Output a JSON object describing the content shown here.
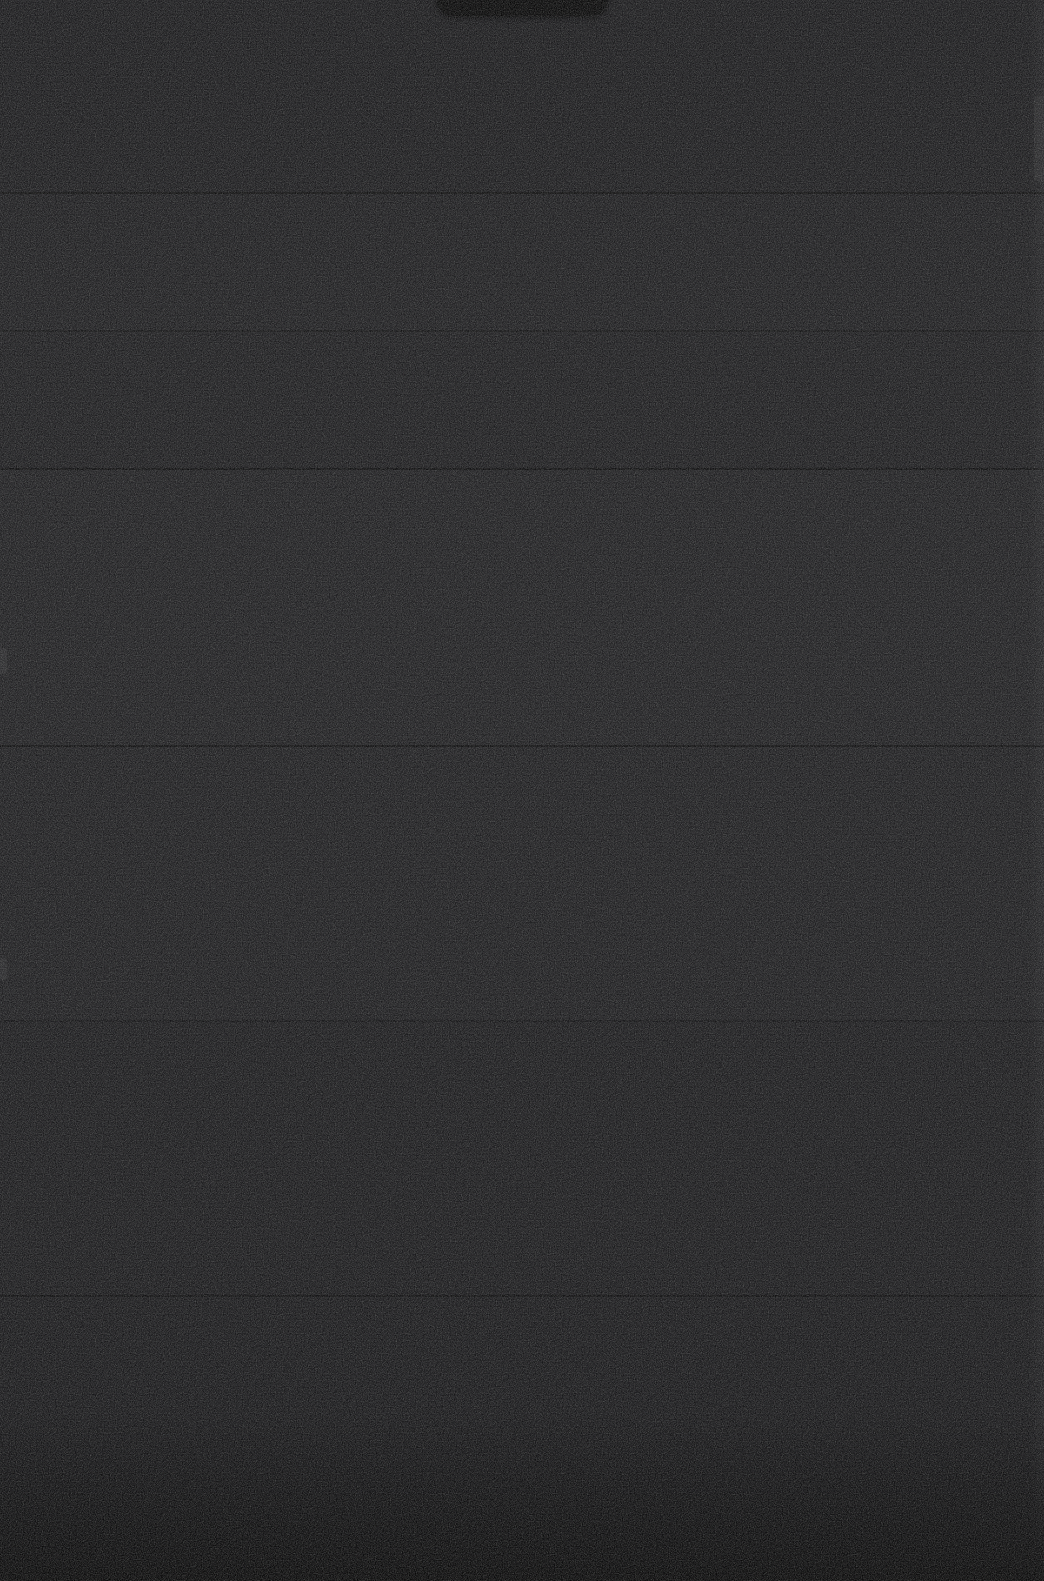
{
  "capture": {
    "width": 1044,
    "height": 1581,
    "screen_state": "",
    "background_color": "#101012",
    "divider_color": "#000000",
    "edge_highlight_color": "#2a2a2e"
  },
  "status_bar": {
    "left_text": "",
    "right_text": ""
  },
  "notch": {
    "label": ""
  },
  "sections": [
    {
      "label": "",
      "top": 0,
      "height": 192,
      "tint": "rgba(255,255,255,0.008)"
    },
    {
      "label": "",
      "top": 194,
      "height": 136,
      "tint": "rgba(255,255,255,0.013)"
    },
    {
      "label": "",
      "top": 332,
      "height": 136,
      "tint": "rgba(255,255,255,0.006)"
    },
    {
      "label": "",
      "top": 470,
      "height": 275,
      "tint": "rgba(255,255,255,0.016)"
    },
    {
      "label": "",
      "top": 747,
      "height": 273,
      "tint": "rgba(255,255,255,0.010)"
    },
    {
      "label": "",
      "top": 1022,
      "height": 273,
      "tint": "rgba(255,255,255,0.004)"
    },
    {
      "label": "",
      "top": 1297,
      "height": 284,
      "tint": "rgba(255,255,255,0.000)"
    }
  ],
  "dividers": [
    {
      "y": 192,
      "strength": "strong"
    },
    {
      "y": 330,
      "strength": "soft"
    },
    {
      "y": 468,
      "strength": "strong"
    },
    {
      "y": 745,
      "strength": "strong"
    },
    {
      "y": 1020,
      "strength": "soft"
    },
    {
      "y": 1295,
      "strength": "strong"
    }
  ],
  "edge_marks": [
    {
      "y": 648,
      "height": 26
    },
    {
      "y": 958,
      "height": 22
    }
  ],
  "right_highlight": {
    "y": 96,
    "height": 86
  }
}
